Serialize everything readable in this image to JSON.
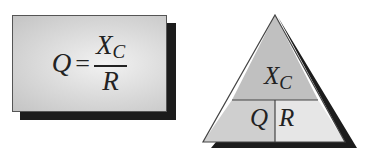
{
  "formula_box": {
    "lhs": "Q",
    "equals": "=",
    "numerator": "X",
    "numerator_subscript": "C",
    "denominator": "R"
  },
  "triangle": {
    "top": {
      "label": "X",
      "subscript": "C"
    },
    "bottom_left": {
      "label": "Q"
    },
    "bottom_right": {
      "label": "R"
    }
  },
  "colors": {
    "shadow": "#1c1c1c",
    "box_fill": "#d6d6d6",
    "triangle_top_fill": "#c0c0c0",
    "triangle_bottom_left_fill": "#cfcfcf",
    "triangle_bottom_right_fill": "#e6e6e6",
    "line": "#444444"
  }
}
